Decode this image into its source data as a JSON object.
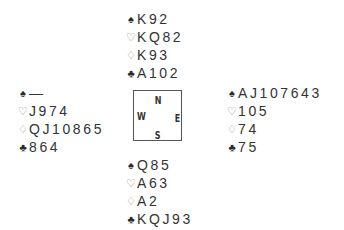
{
  "deal": {
    "north": [
      {
        "suit": "spades",
        "symbol": "♠",
        "cards": "K92"
      },
      {
        "suit": "hearts",
        "symbol": "♡",
        "cards": "KQ82"
      },
      {
        "suit": "diamonds",
        "symbol": "♢",
        "cards": "K93"
      },
      {
        "suit": "clubs",
        "symbol": "♣",
        "cards": "A102"
      }
    ],
    "west": [
      {
        "suit": "spades",
        "symbol": "♠",
        "cards": "—"
      },
      {
        "suit": "hearts",
        "symbol": "♡",
        "cards": "J974"
      },
      {
        "suit": "diamonds",
        "symbol": "♢",
        "cards": "QJ10865"
      },
      {
        "suit": "clubs",
        "symbol": "♣",
        "cards": "864"
      }
    ],
    "east": [
      {
        "suit": "spades",
        "symbol": "♠",
        "cards": "AJ107643"
      },
      {
        "suit": "hearts",
        "symbol": "♡",
        "cards": "105"
      },
      {
        "suit": "diamonds",
        "symbol": "♢",
        "cards": "74"
      },
      {
        "suit": "clubs",
        "symbol": "♣",
        "cards": "75"
      }
    ],
    "south": [
      {
        "suit": "spades",
        "symbol": "♠",
        "cards": "Q85"
      },
      {
        "suit": "hearts",
        "symbol": "♡",
        "cards": "A63"
      },
      {
        "suit": "diamonds",
        "symbol": "♢",
        "cards": "A2"
      },
      {
        "suit": "clubs",
        "symbol": "♣",
        "cards": "KQJ93"
      }
    ]
  },
  "compass": {
    "north": "N",
    "west": "W",
    "east": "E",
    "south": "S"
  },
  "colors": {
    "text": "#333333",
    "red_suit_outline": "#8a8a8a",
    "black_suit": "#2b2b2b",
    "box_border": "#555555"
  }
}
